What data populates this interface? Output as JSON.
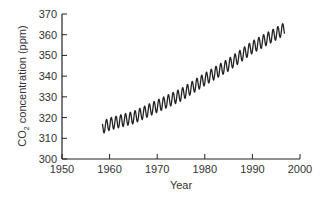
{
  "chart_data": {
    "type": "line",
    "title": "",
    "xlabel": "Year",
    "ylabel": "CO2 concentration (ppm)",
    "ylabel_parts": {
      "pre": "CO",
      "sub": "2",
      "post": " concentration (ppm)"
    },
    "xlim": [
      1950,
      2000
    ],
    "ylim": [
      300,
      370
    ],
    "x_ticks": [
      1950,
      1960,
      1970,
      1980,
      1990,
      2000
    ],
    "y_ticks": [
      300,
      310,
      320,
      330,
      340,
      350,
      360,
      370
    ],
    "grid": false,
    "legend": null,
    "series": [
      {
        "name": "CO2 concentration",
        "color": "#222222",
        "description": "Monthly mean atmospheric CO2 with seasonal oscillation (~6 ppm peak-to-trough)",
        "start_year": 1958.5,
        "end_year": 1996.8,
        "seasonal_amplitude": 3,
        "trend": {
          "x": [
            1958.5,
            1960,
            1965,
            1970,
            1975,
            1980,
            1985,
            1990,
            1995,
            1996.8
          ],
          "y": [
            315.2,
            316.9,
            320.0,
            325.5,
            331.0,
            338.5,
            345.5,
            354.0,
            360.5,
            363.0
          ]
        }
      }
    ]
  }
}
